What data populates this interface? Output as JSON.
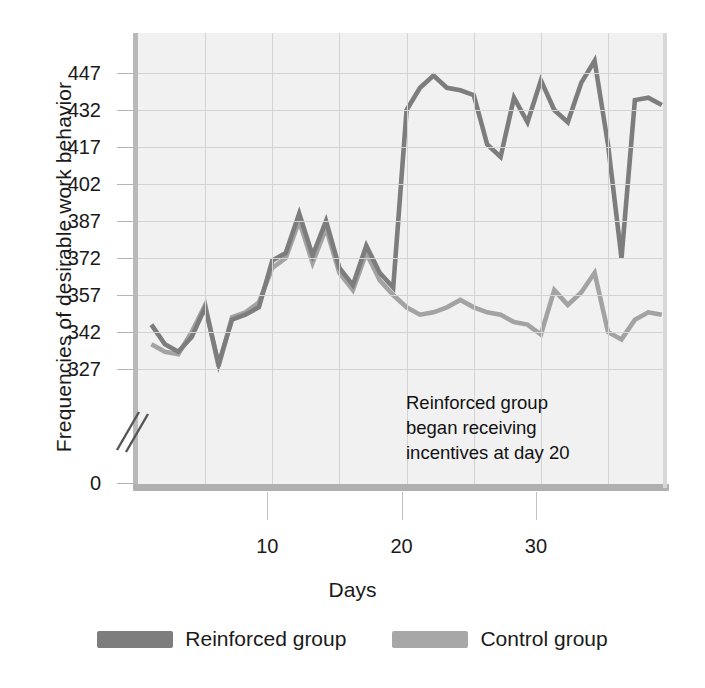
{
  "chart_data": {
    "type": "line",
    "title": "",
    "xlabel": "Days",
    "ylabel": "Frequencies of desirable work behavior",
    "xlim": [
      0,
      39
    ],
    "ylim": [
      320,
      455
    ],
    "yticks": [
      0,
      327,
      342,
      357,
      372,
      387,
      402,
      417,
      432,
      447
    ],
    "ytick_labels": [
      "0",
      "327",
      "342",
      "357",
      "372",
      "387",
      "402",
      "417",
      "432",
      "447"
    ],
    "xticks": [
      10,
      20,
      30
    ],
    "xtick_labels": [
      "10",
      "20",
      "30"
    ],
    "axis_break": true,
    "grid": true,
    "legend_position": "bottom",
    "annotation": "Reinforced group\nbegan receiving\nincentives at day 20",
    "x": [
      1,
      2,
      3,
      4,
      5,
      6,
      7,
      8,
      9,
      10,
      11,
      12,
      13,
      14,
      15,
      16,
      17,
      18,
      19,
      20,
      21,
      22,
      23,
      24,
      25,
      26,
      27,
      28,
      29,
      30,
      31,
      32,
      33,
      34,
      35,
      36,
      37,
      38,
      39
    ],
    "series": [
      {
        "name": "Reinforced group",
        "color": "#7d7d7d",
        "values": [
          345,
          337,
          334,
          340,
          352,
          329,
          347,
          349,
          352,
          371,
          374,
          390,
          373,
          387,
          368,
          361,
          377,
          366,
          360,
          432,
          441,
          446,
          441,
          440,
          438,
          418,
          413,
          437,
          427,
          444,
          432,
          427,
          443,
          452,
          418,
          372,
          436,
          437,
          434
        ]
      },
      {
        "name": "Control group",
        "color": "#a3a3a3",
        "values": [
          337,
          334,
          333,
          342,
          353,
          328,
          348,
          350,
          354,
          368,
          372,
          387,
          370,
          384,
          366,
          359,
          374,
          363,
          357,
          352,
          349,
          350,
          352,
          355,
          352,
          350,
          349,
          346,
          345,
          341,
          359,
          353,
          358,
          366,
          342,
          339,
          347,
          350,
          349
        ]
      }
    ]
  },
  "legend": {
    "items": [
      {
        "label": "Reinforced group",
        "color": "#7d7d7d"
      },
      {
        "label": "Control group",
        "color": "#a7a7a7"
      }
    ]
  }
}
